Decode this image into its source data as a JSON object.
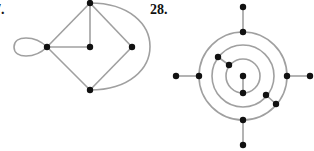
{
  "figures": [
    {
      "label": "7.",
      "nodes": [
        {
          "id": "top",
          "x": 90,
          "y": 3
        },
        {
          "id": "left",
          "x": 47,
          "y": 47
        },
        {
          "id": "center",
          "x": 90,
          "y": 47
        },
        {
          "id": "right",
          "x": 132,
          "y": 47
        },
        {
          "id": "bottom",
          "x": 90,
          "y": 90
        }
      ],
      "edges": [
        "top-left",
        "top-center",
        "top-right",
        "left-center",
        "left-bottom",
        "right-bottom",
        "left-loop",
        "top-bottom-arc"
      ]
    },
    {
      "label": "28.",
      "nodes": 15,
      "circles": 3
    }
  ],
  "colors": {
    "edge": "#a0a0a0",
    "node": "#111111"
  }
}
